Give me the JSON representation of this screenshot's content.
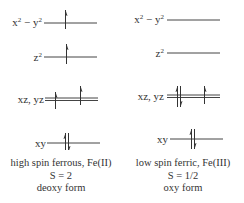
{
  "diagram": {
    "type": "d-orbital energy level diagram",
    "panels": [
      {
        "id": "left",
        "levels": [
          {
            "label": "x² − y²",
            "label_base": "x",
            "label_exp1": "2",
            "label_mid": " − y",
            "label_exp2": "2",
            "electrons": [
              "up"
            ]
          },
          {
            "label": "z²",
            "label_base": "z",
            "label_exp1": "2",
            "electrons": [
              "up"
            ]
          },
          {
            "label": "xz, yz",
            "electrons": [
              "up",
              "up"
            ],
            "degenerate": true
          },
          {
            "label": "xy",
            "electrons": [
              "up",
              "down"
            ]
          }
        ],
        "caption": {
          "line1": "high spin ferrous, Fe(II)",
          "line2": "S = 2",
          "line3": "deoxy form"
        }
      },
      {
        "id": "right",
        "levels": [
          {
            "label": "x² − y²",
            "label_base": "x",
            "label_exp1": "2",
            "label_mid": " − y",
            "label_exp2": "2",
            "electrons": []
          },
          {
            "label": "z²",
            "label_base": "z",
            "label_exp1": "2",
            "electrons": []
          },
          {
            "label": "xz, yz",
            "electrons": [
              "up",
              "down",
              "up"
            ],
            "degenerate": true
          },
          {
            "label": "xy",
            "electrons": [
              "up",
              "down"
            ]
          }
        ],
        "caption": {
          "line1": "low spin ferric, Fe(III)",
          "line2": "S = 1/2",
          "line3": "oxy form"
        }
      }
    ],
    "colors": {
      "line": "#444444",
      "text": "#333333",
      "background": "#ffffff"
    }
  }
}
